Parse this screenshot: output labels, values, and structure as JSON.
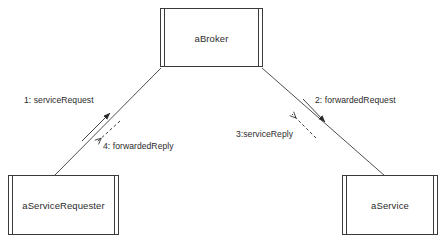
{
  "diagram": {
    "type": "uml-collaboration-diagram",
    "background_color": "#ffffff",
    "line_color": "#3a3a3a",
    "text_color": "#2b2b2b",
    "objects": [
      {
        "id": "broker",
        "label": "aBroker",
        "role": "broker"
      },
      {
        "id": "requester",
        "label": "aServiceRequester",
        "role": "client"
      },
      {
        "id": "service",
        "label": "aService",
        "role": "server"
      }
    ],
    "links": [
      {
        "id": "link-requester-broker",
        "from": "requester",
        "to": "broker"
      },
      {
        "id": "link-broker-service",
        "from": "broker",
        "to": "service"
      }
    ],
    "messages": [
      {
        "sequence": "1",
        "label": "1: serviceRequest",
        "name": "serviceRequest",
        "from": "aServiceRequester",
        "to": "aBroker",
        "kind": "call",
        "arrow_style": "solid-filled",
        "direction": "up-right"
      },
      {
        "sequence": "2",
        "label": "2: forwardedRequest",
        "name": "forwardedRequest",
        "from": "aBroker",
        "to": "aService",
        "kind": "call",
        "arrow_style": "solid-filled",
        "direction": "down-right"
      },
      {
        "sequence": "3",
        "label": "3:serviceReply",
        "name": "serviceReply",
        "from": "aService",
        "to": "aBroker",
        "kind": "return",
        "arrow_style": "dashed-open",
        "direction": "up-left"
      },
      {
        "sequence": "4",
        "label": "4: forwardedReply",
        "name": "forwardedReply",
        "from": "aBroker",
        "to": "aServiceRequester",
        "kind": "return",
        "arrow_style": "dashed-open",
        "direction": "down-left"
      }
    ]
  }
}
